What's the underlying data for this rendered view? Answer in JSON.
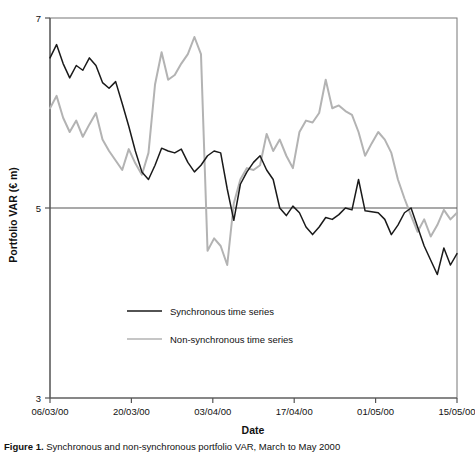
{
  "figure": {
    "caption_prefix": "Figure 1.",
    "caption_text": "  Synchronous and non-synchronous portfolio VAR, March to May 2000"
  },
  "axes": {
    "y_label": "Portfolio VAR (€ m)",
    "x_label": "Date",
    "y_ticks": [
      "7",
      "5",
      "3"
    ],
    "y_tick_values": [
      7,
      5,
      3
    ],
    "x_ticks": [
      "06/03/00",
      "20/03/00",
      "03/04/00",
      "17/04/00",
      "01/05/00",
      "15/05/00"
    ]
  },
  "legend": {
    "items": [
      {
        "label": "Synchronous time series",
        "color": "#1a1a1a"
      },
      {
        "label": "Non-synchronous time series",
        "color": "#b3b3b3"
      }
    ]
  },
  "colors": {
    "synchronous": "#1a1a1a",
    "non_synchronous": "#b3b3b3",
    "axis": "#555555",
    "gridline": "#555555"
  },
  "chart_data": {
    "type": "line",
    "title": "",
    "xlabel": "Date",
    "ylabel": "Portfolio VAR (€ m)",
    "ylim": [
      3,
      7
    ],
    "xlim": [
      0,
      60
    ],
    "grid": "horizontal-at-5-and-7",
    "legend_position": "inside-lower-left",
    "x_tick_labels": [
      "06/03/00",
      "20/03/00",
      "03/04/00",
      "17/04/00",
      "01/05/00",
      "15/05/00"
    ],
    "x_tick_positions": [
      0,
      12,
      24,
      36,
      48,
      60
    ],
    "series": [
      {
        "name": "Synchronous time series",
        "color": "#1a1a1a",
        "values": [
          6.58,
          6.72,
          6.52,
          6.37,
          6.5,
          6.45,
          6.58,
          6.5,
          6.32,
          6.26,
          6.33,
          6.1,
          5.86,
          5.6,
          5.38,
          5.3,
          5.45,
          5.63,
          5.6,
          5.58,
          5.62,
          5.48,
          5.38,
          5.45,
          5.55,
          5.6,
          5.58,
          5.2,
          4.87,
          5.25,
          5.38,
          5.48,
          5.55,
          5.4,
          5.3,
          5.0,
          4.92,
          5.02,
          4.95,
          4.8,
          4.72,
          4.8,
          4.9,
          4.88,
          4.93,
          5.0,
          4.98,
          5.3,
          4.97,
          4.96,
          4.95,
          4.88,
          4.72,
          4.82,
          4.95,
          5.0,
          4.8,
          4.6,
          4.45,
          4.3,
          4.58,
          4.4,
          4.52
        ]
      },
      {
        "name": "Non-synchronous time series",
        "color": "#b3b3b3",
        "values": [
          6.05,
          6.18,
          5.95,
          5.8,
          5.92,
          5.75,
          5.88,
          6.0,
          5.72,
          5.6,
          5.5,
          5.4,
          5.62,
          5.47,
          5.35,
          5.58,
          6.3,
          6.64,
          6.35,
          6.4,
          6.52,
          6.62,
          6.8,
          6.62,
          4.55,
          4.68,
          4.6,
          4.4,
          5.05,
          5.3,
          5.42,
          5.4,
          5.45,
          5.78,
          5.6,
          5.72,
          5.55,
          5.42,
          5.8,
          5.92,
          5.9,
          6.0,
          6.35,
          6.05,
          6.08,
          6.02,
          5.98,
          5.8,
          5.55,
          5.68,
          5.8,
          5.72,
          5.58,
          5.3,
          5.1,
          4.92,
          4.75,
          4.88,
          4.7,
          4.82,
          4.98,
          4.88,
          4.95
        ]
      }
    ]
  }
}
